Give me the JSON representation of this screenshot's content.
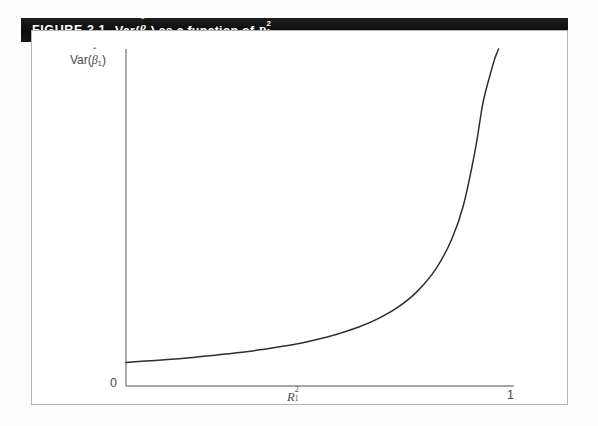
{
  "figure": {
    "caption_label": "FIGURE 3.1",
    "caption_text_plain": "Var(β̂1) as a function of R²₁.",
    "caption_parts": {
      "var_word": "Var(",
      "beta": "β",
      "hat": "ˆ",
      "beta_sub": "1",
      "close_paren": ")",
      "middle": "as a function of",
      "r_symbol": "R",
      "r_sup": "2",
      "r_sub": "1",
      "period": "."
    },
    "frame_border_color": "#b6b6b6",
    "banner_color": "#141414",
    "banner_text_color": "#ffffff"
  },
  "axes": {
    "y_label_parts": {
      "var_word": "Var(",
      "beta": "β",
      "hat": "ˆ",
      "beta_sub": "1",
      "close_paren": ")"
    },
    "y_label_plain": "Var(β̂1)",
    "x_label_parts": {
      "symbol": "R",
      "sup": "2",
      "sub": "1"
    },
    "x_label_plain": "R²₁",
    "origin_label": "0",
    "x_max_label": "1",
    "axis_color": "#8a8a8a",
    "curve_color": "#2e2e2e"
  },
  "chart_data": {
    "type": "line",
    "xlabel": "R²₁",
    "ylabel": "Var(β̂1)",
    "xlim": [
      0,
      1
    ],
    "ylim": [
      0,
      1
    ],
    "xticks": [
      0,
      1
    ],
    "xticklabels": [
      "0",
      "1"
    ],
    "yticks": [
      0
    ],
    "yticklabels": [
      "0"
    ],
    "grid": false,
    "legend": false,
    "series": [
      {
        "name": "Var(beta1-hat)",
        "comment": "Variance inflation curve proportional to 1/(1-R^2), rising to a vertical asymptote at R^2 = 1",
        "x": [
          0.0,
          0.05,
          0.1,
          0.15,
          0.2,
          0.25,
          0.3,
          0.35,
          0.4,
          0.45,
          0.5,
          0.55,
          0.6,
          0.65,
          0.7,
          0.75,
          0.8,
          0.84,
          0.87,
          0.9,
          0.92,
          0.94,
          0.95,
          0.955,
          0.96
        ],
        "y": [
          0.07,
          0.074,
          0.078,
          0.082,
          0.088,
          0.094,
          0.1,
          0.108,
          0.117,
          0.127,
          0.14,
          0.156,
          0.175,
          0.2,
          0.233,
          0.28,
          0.35,
          0.437,
          0.538,
          0.7,
          0.84,
          0.93,
          0.97,
          0.985,
          1.0
        ]
      }
    ]
  }
}
